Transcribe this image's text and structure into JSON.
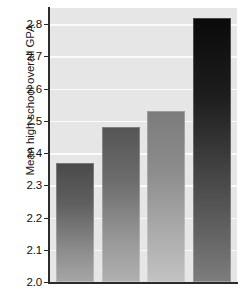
{
  "chart_data": {
    "type": "bar",
    "title": "",
    "xlabel": "",
    "ylabel": "Mean high school overall GPA",
    "categories": [
      "1",
      "2",
      "3",
      "4"
    ],
    "values": [
      2.37,
      2.48,
      2.53,
      2.82
    ],
    "ylim": [
      2.0,
      2.85
    ],
    "y_ticks": [
      2.0,
      2.1,
      2.2,
      2.3,
      2.4,
      2.5,
      2.6,
      2.7,
      2.8
    ],
    "y_tick_labels": [
      "2.0",
      "2.1",
      "2.2",
      "2.3",
      "2.4",
      "2.5",
      "2.6",
      "2.7",
      "2.8"
    ],
    "x_tick_labels": [
      "",
      "",
      "",
      ""
    ],
    "grid": true,
    "grid_orientation": "horizontal",
    "legend": false,
    "legend_position": "none",
    "plot_background": "#e6e6e6",
    "gridline_color": "#fbfbfb",
    "axis_color": "#2b2b2b",
    "bar_colors": [
      "#4a4a4a",
      "#555555",
      "#7c7c7c",
      "#0a0a0a"
    ],
    "bar_color_style": "vertical-gradient-dark-to-light",
    "series": [
      {
        "name": "Mean high school overall GPA",
        "values": [
          2.37,
          2.48,
          2.53,
          2.82
        ]
      }
    ]
  },
  "axis": {
    "y_title": "Mean high school overall GPA"
  }
}
